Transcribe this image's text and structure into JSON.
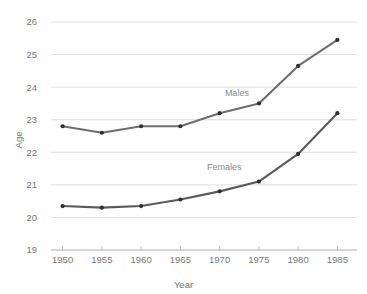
{
  "chart_data": {
    "type": "line",
    "title": "",
    "subtitle": "",
    "xlabel": "Year",
    "ylabel": "Age",
    "x": [
      1950,
      1955,
      1960,
      1965,
      1970,
      1975,
      1980,
      1985
    ],
    "xtick_labels": [
      "1950",
      "1955",
      "1960",
      "1965",
      "1970",
      "1975",
      "1980",
      "1985"
    ],
    "ytick_labels": [
      "19",
      "20",
      "21",
      "22",
      "23",
      "24",
      "25",
      "26"
    ],
    "yticks": [
      19,
      20,
      21,
      22,
      23,
      24,
      25,
      26
    ],
    "xlim": [
      1947.5,
      1987.5
    ],
    "ylim": [
      19,
      26
    ],
    "grid": "horizontal",
    "legend": "inline-annotations",
    "series": [
      {
        "name": "Males",
        "color": "#6e6e6e",
        "values": [
          22.8,
          22.6,
          22.8,
          22.8,
          23.2,
          23.5,
          24.65,
          25.45
        ],
        "annotation": "Males"
      },
      {
        "name": "Females",
        "color": "#5a5a5a",
        "values": [
          20.35,
          20.3,
          20.35,
          20.55,
          20.8,
          21.1,
          21.95,
          23.2
        ],
        "annotation": "Females"
      }
    ],
    "annotations": [
      {
        "text": "Males",
        "x": 1972.2,
        "y": 23.72
      },
      {
        "text": "Females",
        "x": 1970.6,
        "y": 21.47
      }
    ]
  },
  "colors": {
    "background": "#ffffff",
    "gridline": "#d6d6d6",
    "axis": "#b9b9b9",
    "text": "#787878",
    "males_line": "#6e6e6e",
    "females_line": "#5a5a5a",
    "marker": "#303030"
  }
}
